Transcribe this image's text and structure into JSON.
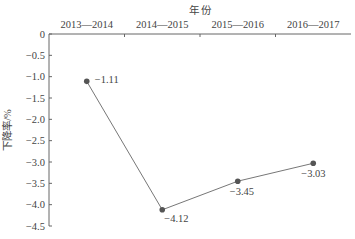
{
  "chart_data": {
    "type": "line",
    "title": "",
    "xlabel": "年 份",
    "ylabel": "下降率/%",
    "categories": [
      "2013—2014",
      "2014—2015",
      "2015—2016",
      "2016—2017"
    ],
    "values": [
      -1.11,
      -4.12,
      -3.45,
      -3.03
    ],
    "data_labels": [
      "−1.11",
      "−4.12",
      "−3.45",
      "−3.03"
    ],
    "x_axis_position": "top",
    "ylim": [
      -4.5,
      0
    ],
    "yticks": [
      0,
      -0.5,
      -1.0,
      -1.5,
      -2.0,
      -2.5,
      -3.0,
      -3.5,
      -4.0,
      -4.5
    ],
    "ytick_labels": [
      "0",
      "−0.5",
      "−1.0",
      "−1.5",
      "−2.0",
      "−2.5",
      "−3.0",
      "−3.5",
      "−4.0",
      "−4.5"
    ],
    "grid": false,
    "legend": null,
    "colors": {
      "line": "#777777",
      "marker": "#555555",
      "axis": "#666666"
    }
  }
}
